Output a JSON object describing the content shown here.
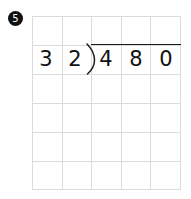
{
  "worksheet": {
    "problem_number": "5",
    "problem_type": "long-division",
    "grid": {
      "columns": 5,
      "rows": 6,
      "line_color": "#dcdcdc",
      "background": "#ffffff"
    },
    "division": {
      "divisor": "32",
      "dividend": "480",
      "quotient": "",
      "divisor_digits": [
        "3",
        "2"
      ],
      "dividend_digits": [
        "4",
        "8",
        "0"
      ],
      "bracket_glyph": ")",
      "ink_color": "#111111"
    },
    "marker": {
      "label": "5",
      "shape": "filled-circle",
      "fill": "#111111",
      "text_color": "#ffffff"
    }
  }
}
